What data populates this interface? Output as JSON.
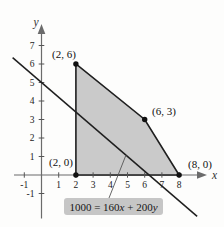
{
  "chart_data": {
    "type": "area",
    "title": "",
    "xlabel": "x",
    "ylabel": "y",
    "xlim": [
      -1.5,
      9.2
    ],
    "ylim": [
      -2.4,
      8.1
    ],
    "grid": false,
    "x_ticks": [
      -1,
      1,
      2,
      3,
      4,
      5,
      6,
      7,
      8
    ],
    "y_ticks": [
      -1,
      1,
      2,
      3,
      4,
      5,
      6,
      7
    ],
    "region": {
      "fill": "#cacaca",
      "stroke": "#1f1f1f",
      "points": [
        {
          "x": 2,
          "y": 0,
          "label": "(2, 0)"
        },
        {
          "x": 2,
          "y": 6,
          "label": "(2, 6)"
        },
        {
          "x": 6,
          "y": 3,
          "label": "(6, 3)"
        },
        {
          "x": 8,
          "y": 0,
          "label": "(8, 0)"
        }
      ]
    },
    "objective_line": {
      "a": 160,
      "b": 200,
      "c": 1000,
      "equation_label": "1000 = 160x + 200y",
      "x_intercept": 6.25,
      "y_intercept": 5,
      "x_range": [
        -1.68,
        9.05
      ],
      "color": "#1f1f1f"
    }
  },
  "equation": {
    "prefix": "1000 = 160",
    "var1": "x",
    "mid": " + 200",
    "var2": "y"
  },
  "colors": {
    "axis": "#6b6b6b",
    "tick": "#555555",
    "leader": "#555555",
    "dot": "#111111"
  }
}
